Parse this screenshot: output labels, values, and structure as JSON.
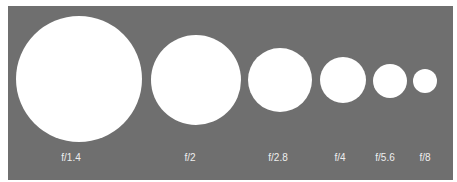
{
  "diagram": {
    "title": "",
    "colors": {
      "background": "#6f6f6f",
      "aperture": "#ffffff",
      "label": "#eeeeee"
    },
    "apertures": [
      {
        "label": "f/1.4",
        "cx": 79,
        "cy": 79,
        "r": 63
      },
      {
        "label": "f/2",
        "cx": 196,
        "cy": 80,
        "r": 45
      },
      {
        "label": "f/2.8",
        "cx": 280,
        "cy": 80,
        "r": 32
      },
      {
        "label": "f/4",
        "cx": 343,
        "cy": 80,
        "r": 23
      },
      {
        "label": "f/5.6",
        "cx": 390,
        "cy": 81,
        "r": 17
      },
      {
        "label": "f/8",
        "cx": 425,
        "cy": 81,
        "r": 12
      }
    ]
  }
}
